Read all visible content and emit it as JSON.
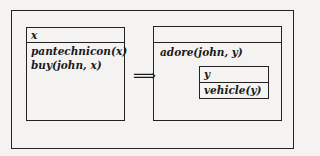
{
  "diagram": {
    "type": "DRS transformation",
    "left_drs": {
      "universe": "x",
      "conditions": [
        "pantechnicon(x)",
        "buy(john, x)"
      ]
    },
    "arrow": "⟹",
    "right_drs": {
      "universe": "",
      "conditions": [
        "adore(john, y)"
      ],
      "nested_drs": {
        "universe": "y",
        "conditions": [
          "vehicle(y)"
        ]
      }
    }
  }
}
